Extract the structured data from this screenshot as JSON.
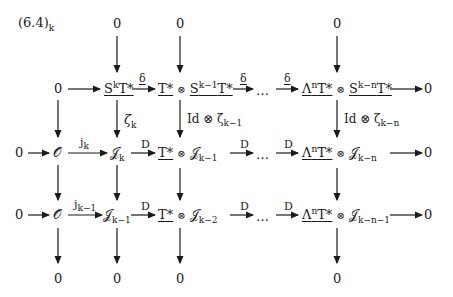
{
  "title": "(6.4)",
  "title_sub": "k",
  "zero": "0",
  "rows": {
    "row1": {
      "s_k": "S",
      "s_k_sup": "k",
      "s_k_T": "T*",
      "delta": "δ",
      "t_star": "T*",
      "otimes": "⊗",
      "s_k1": "S",
      "s_k1_sup": "k−1",
      "s_k1_T": "T*",
      "dots": "…",
      "lambda": "Λ",
      "lambda_sup": "n",
      "lambda_T": "T*",
      "s_kn": "S",
      "s_kn_sup": "k−n",
      "s_kn_T": "T*"
    },
    "row2": {
      "O": "𝒪",
      "j_label": "j",
      "j_sub": "k",
      "J": "𝒥",
      "J_sub": "k",
      "D": "D",
      "t_star": "T*",
      "otimes": "⊗",
      "J2": "𝒥",
      "J2_sub": "k−1",
      "dots": "…",
      "lambda": "Λ",
      "lambda_sup": "n",
      "lambda_T": "T*",
      "J3": "𝒥",
      "J3_sub": "k−n"
    },
    "row3": {
      "O": "𝒪",
      "j_label": "j",
      "j_sub": "k−1",
      "J": "𝒥",
      "J_sub": "k−1",
      "D": "D",
      "t_star": "T*",
      "otimes": "⊗",
      "J2": "𝒥",
      "J2_sub": "k−2",
      "dots": "…",
      "lambda": "Λ",
      "lambda_sup": "n",
      "lambda_T": "T*",
      "J3": "𝒥",
      "J3_sub": "k−n−1"
    }
  },
  "vertical_labels": {
    "zeta": "ζ",
    "zeta_sub": "k",
    "id_zeta": "Id ⊗ ζ",
    "id_zeta_sub": "k−1",
    "id_zeta_n": "Id ⊗ ζ",
    "id_zeta_n_sub": "k−n"
  }
}
